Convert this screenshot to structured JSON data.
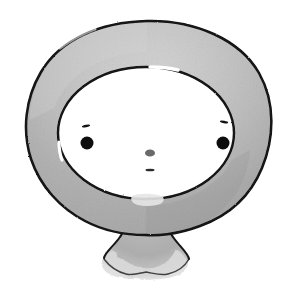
{
  "artwork": {
    "title": "Ink and wash drawing of a ring-shaped face character",
    "medium": "ink-and-gray-wash",
    "canvas": {
      "width": 299,
      "height": 285,
      "background_color": "#ffffff"
    },
    "palette": {
      "background": "#ffffff",
      "wash_gray": "#ababab",
      "wash_gray_light": "#c2c2c2",
      "wash_gray_dark": "#9a9a9a",
      "wash_gray_pale": "#d8d8d8",
      "ink_black": "#141414",
      "feature_black": "#101010",
      "nose_gray": "#6a6a6a"
    },
    "elements": {
      "ring_body": {
        "label": "Ring-shaped head outline",
        "outer_bounds": {
          "x": 25,
          "y": 20,
          "width": 247,
          "height": 225
        },
        "inner_bounds": {
          "x": 58,
          "y": 68,
          "width": 172,
          "height": 130
        }
      },
      "inner_face": {
        "label": "Blank white face area",
        "center": {
          "x": 146,
          "y": 133
        },
        "radius_x": 88,
        "radius_y": 66
      },
      "stem": {
        "label": "Neck stem flaring into a scalloped base",
        "bounds": {
          "x": 103,
          "y": 205,
          "width": 85,
          "height": 75
        }
      },
      "left_eye": {
        "label": "Left eye dot",
        "cx": 87,
        "cy": 143,
        "r": 6.5,
        "color": "#101010"
      },
      "right_eye": {
        "label": "Right eye dot",
        "cx": 223,
        "cy": 143,
        "r": 6.5,
        "color": "#101010"
      },
      "left_brow": {
        "label": "Left eyebrow tick",
        "cx": 86,
        "cy": 126,
        "width": 8,
        "height": 2.2
      },
      "right_brow": {
        "label": "Right eyebrow tick",
        "cx": 224,
        "cy": 122,
        "width": 8,
        "height": 2.2
      },
      "nose": {
        "label": "Nose dot",
        "cx": 150,
        "cy": 153,
        "rx": 5,
        "ry": 3.6,
        "color": "#6a6a6a"
      },
      "mouth": {
        "label": "Mouth dash",
        "cx": 150,
        "cy": 170,
        "width": 9,
        "height": 2.4,
        "color": "#2a2a2a"
      }
    }
  }
}
